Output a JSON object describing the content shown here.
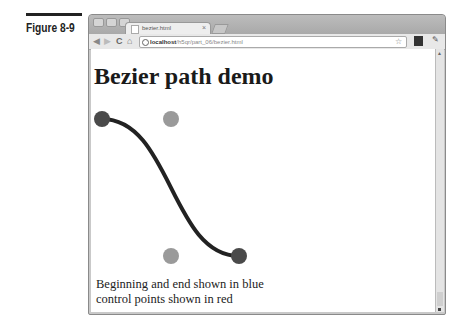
{
  "figure": {
    "label": "Figure 8-9"
  },
  "browser": {
    "tab_title": "bezier.html",
    "tab_close": "×",
    "url_host": "localhost",
    "url_path": "/h5qr/part_06/bezier.html",
    "nav": {
      "back": "◀",
      "forward": "▶",
      "reload": "C",
      "home": "⌂"
    },
    "star": "☆",
    "wrench": "✎"
  },
  "page": {
    "heading": "Bezier path demo",
    "caption_line1": "Beginning and end shown in blue",
    "caption_line2": "control points shown in red"
  },
  "curve": {
    "start": [
      11,
      70
    ],
    "cp1": [
      80,
      70
    ],
    "cp2": [
      80,
      207
    ],
    "end": [
      148,
      207
    ],
    "endpoint_color": "#4a4a4a",
    "control_color": "#9a9a9a",
    "stroke_color": "#222222"
  }
}
